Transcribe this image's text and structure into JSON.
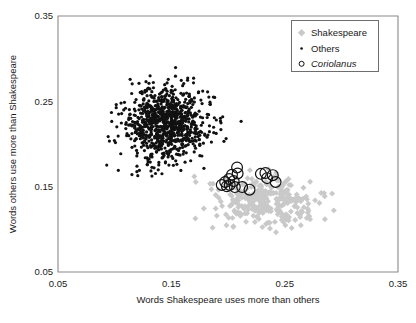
{
  "figure": {
    "background_color": "#ffffff",
    "frame_color": "#8a8a8a"
  },
  "axes": {
    "x": {
      "title": "Words Shakespeare uses more than others",
      "tick_labels": [
        "0.05",
        "0.15",
        "0.25",
        "0.35"
      ],
      "tick_values": [
        0.05,
        0.15,
        0.25,
        0.35
      ],
      "min": 0.05,
      "max": 0.35
    },
    "y": {
      "title": "Words others use more than Shakespeare",
      "tick_labels": [
        "0.05",
        "0.15",
        "0.25",
        "0.35"
      ],
      "tick_values": [
        0.05,
        0.15,
        0.25,
        0.35
      ],
      "min": 0.05,
      "max": 0.35
    }
  },
  "legend": {
    "position": "top-right",
    "entries": [
      {
        "label": "Shakespeare",
        "marker": "diamond",
        "color": "#c9c9c9",
        "italic": false
      },
      {
        "label": "Others",
        "marker": "dot",
        "color": "#111111",
        "italic": false
      },
      {
        "label": "Coriolanus",
        "marker": "circle",
        "color": "#111111",
        "italic": true
      }
    ]
  },
  "chart_data": {
    "type": "scatter",
    "title": "",
    "xlabel": "Words Shakespeare uses more than others",
    "ylabel": "Words others use more than Shakespeare",
    "xlim": [
      0.05,
      0.35
    ],
    "ylim": [
      0.05,
      0.35
    ],
    "grid": false,
    "legend_position": "top-right",
    "series": [
      {
        "name": "Others",
        "marker": "dot",
        "color": "#111111",
        "size": 1.6,
        "description": "Dense cloud of ~900 non-Shakespeare works centred near (0.145, 0.225)",
        "cluster": {
          "n": 900,
          "mean_x": 0.145,
          "mean_y": 0.224,
          "sd_x": 0.019,
          "sd_y": 0.022,
          "corr": 0.05,
          "seed": 20240115
        }
      },
      {
        "name": "Shakespeare",
        "marker": "diamond",
        "color": "#c9c9c9",
        "size": 4.2,
        "description": "Cloud of ~300 Shakespeare works centred near (0.232, 0.133)",
        "cluster": {
          "n": 300,
          "mean_x": 0.232,
          "mean_y": 0.133,
          "sd_x": 0.024,
          "sd_y": 0.014,
          "corr": -0.15,
          "seed": 7781
        }
      },
      {
        "name": "Coriolanus",
        "marker": "circle",
        "color": "#111111",
        "size": 5.4,
        "points": [
          [
            0.1945,
            0.152
          ],
          [
            0.1975,
            0.1555
          ],
          [
            0.199,
            0.1505
          ],
          [
            0.201,
            0.159
          ],
          [
            0.2015,
            0.152
          ],
          [
            0.2035,
            0.164
          ],
          [
            0.205,
            0.1565
          ],
          [
            0.206,
            0.1495
          ],
          [
            0.208,
            0.1725
          ],
          [
            0.2085,
            0.1655
          ],
          [
            0.2125,
            0.1495
          ],
          [
            0.219,
            0.1465
          ],
          [
            0.229,
            0.165
          ],
          [
            0.233,
            0.166
          ],
          [
            0.2345,
            0.16
          ],
          [
            0.2395,
            0.1635
          ],
          [
            0.242,
            0.1555
          ]
        ]
      }
    ]
  }
}
